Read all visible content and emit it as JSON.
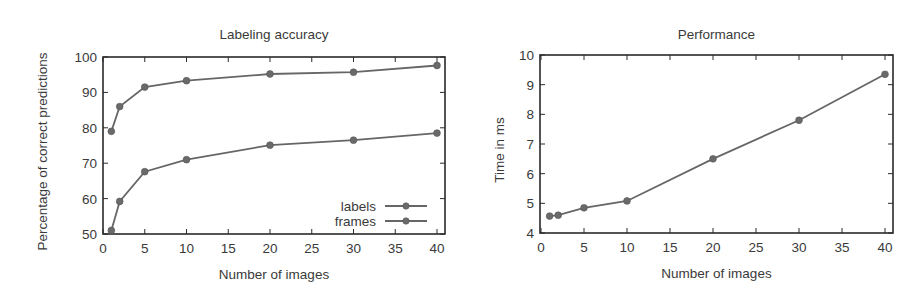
{
  "figure": {
    "width": 923,
    "height": 297,
    "line_color": "#666666",
    "frame_color": "#2a2a2a",
    "text_color": "#3a3a3a"
  },
  "chart_data": [
    {
      "type": "line",
      "title": "Labeling accuracy",
      "xlabel": "Number of images",
      "ylabel": "Percentage of correct predictions",
      "xlim": [
        0,
        40
      ],
      "ylim": [
        50,
        100
      ],
      "xticks": [
        0,
        5,
        10,
        15,
        20,
        25,
        30,
        35,
        40
      ],
      "yticks": [
        50,
        60,
        70,
        80,
        90,
        100
      ],
      "grid": false,
      "legend_position": "lower right",
      "x": [
        1,
        2,
        5,
        10,
        20,
        30,
        40
      ],
      "series": [
        {
          "name": "labels",
          "values": [
            79.0,
            86.0,
            91.5,
            93.3,
            95.2,
            95.7,
            97.6
          ]
        },
        {
          "name": "frames",
          "values": [
            51.0,
            59.2,
            67.6,
            71.0,
            75.1,
            76.5,
            78.5
          ]
        }
      ],
      "frame": {
        "left": 103,
        "top": 57,
        "right": 445,
        "bottom": 234,
        "x0px": 103,
        "x1px": 437
      }
    },
    {
      "type": "line",
      "title": "Performance",
      "xlabel": "Number of images",
      "ylabel": "Time in ms",
      "xlim": [
        0,
        40
      ],
      "ylim": [
        4,
        10
      ],
      "xticks": [
        0,
        5,
        10,
        15,
        20,
        25,
        30,
        35,
        40
      ],
      "yticks": [
        4,
        5,
        6,
        7,
        8,
        9,
        10
      ],
      "grid": false,
      "legend_position": "none",
      "x": [
        1,
        2,
        5,
        10,
        20,
        30,
        40
      ],
      "series": [
        {
          "name": "time",
          "values": [
            4.57,
            4.6,
            4.85,
            5.08,
            6.5,
            7.8,
            9.35
          ]
        }
      ],
      "frame": {
        "left": 540,
        "top": 55,
        "right": 893,
        "bottom": 233,
        "x0px": 541,
        "x1px": 885
      }
    }
  ]
}
